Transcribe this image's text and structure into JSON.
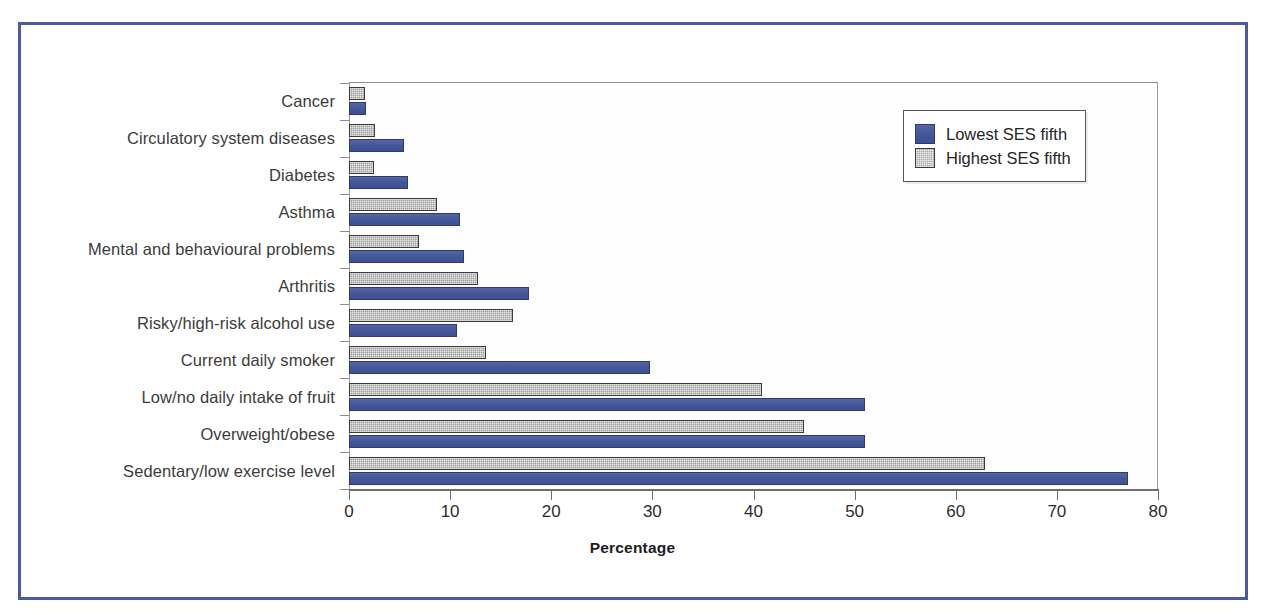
{
  "chart_data": {
    "type": "bar",
    "orientation": "horizontal",
    "title": "",
    "xlabel": "Percentage",
    "ylabel": "",
    "xlim": [
      0,
      80
    ],
    "xticks": [
      0,
      10,
      20,
      30,
      40,
      50,
      60,
      70,
      80
    ],
    "grid": false,
    "legend_position": "top-right",
    "categories": [
      "Cancer",
      "Circulatory system diseases",
      "Diabetes",
      "Asthma",
      "Mental and behavioural problems",
      "Arthritis",
      "Risky/high-risk alcohol use",
      "Current daily smoker",
      "Low/no daily intake of fruit",
      "Overweight/obese",
      "Sedentary/low exercise level"
    ],
    "series": [
      {
        "name": "Lowest SES fifth",
        "color": "#4a5da0",
        "values": [
          1.7,
          5.4,
          5.8,
          11.0,
          11.4,
          17.8,
          10.7,
          29.8,
          51.0,
          51.0,
          77.0
        ]
      },
      {
        "name": "Highest SES fifth",
        "color": "#9c9c9c",
        "values": [
          1.6,
          2.6,
          2.5,
          8.7,
          6.9,
          12.8,
          16.2,
          13.5,
          40.8,
          45.0,
          62.9
        ]
      }
    ]
  },
  "legend": {
    "items": [
      {
        "label": "Lowest SES fifth",
        "swatch": "blue-solid-swatch"
      },
      {
        "label": "Highest SES fifth",
        "swatch": "gray-hatched-swatch"
      }
    ]
  },
  "axis": {
    "x_title": "Percentage",
    "x_tick_labels": [
      "0",
      "10",
      "20",
      "30",
      "40",
      "50",
      "60",
      "70",
      "80"
    ]
  },
  "colors": {
    "frame_border": "#4a5a9c",
    "series_low": "#4a5da0",
    "series_high": "#9c9c9c",
    "axis": "#6f6f6f",
    "text": "#2d2d2d"
  }
}
